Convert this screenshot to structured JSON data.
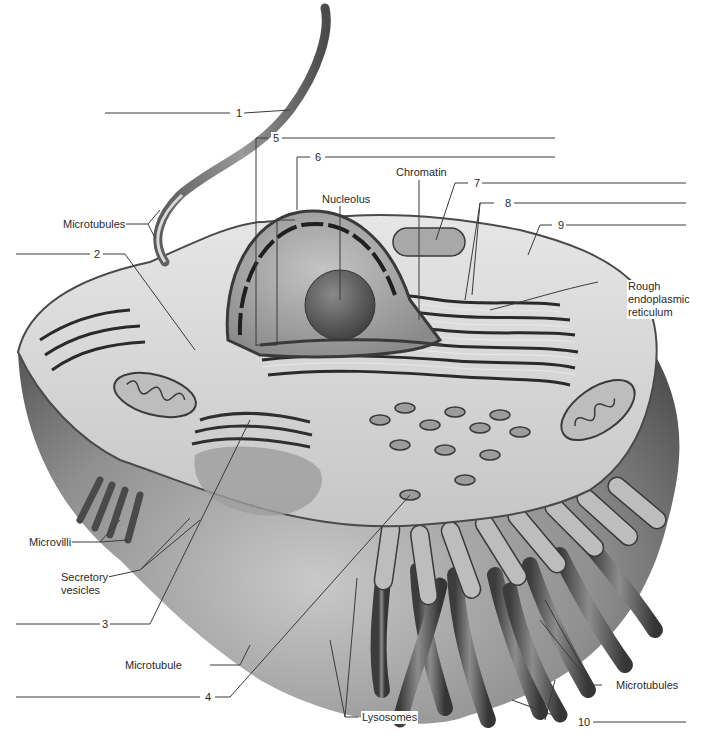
{
  "diagram": {
    "blank_numbers": [
      "1",
      "2",
      "3",
      "4",
      "5",
      "6",
      "7",
      "8",
      "9",
      "10"
    ],
    "labels": {
      "microtubules_flagellum": "Microtubules",
      "nucleolus": "Nucleolus",
      "chromatin": "Chromatin",
      "rough_er_line1": "Rough",
      "rough_er_line2": "endoplasmic",
      "rough_er_line3": "reticulum",
      "microvilli": "Microvilli",
      "secretory_line1": "Secretory",
      "secretory_line2": "vesicles",
      "microtubule": "Microtubule",
      "lysosomes": "Lysosomes",
      "microtubules_cilia": "Microtubules"
    },
    "colors": {
      "background": "#ffffff",
      "leader_line": "#3a3a3a",
      "cytoplasm": "#d8d8d8",
      "membrane_dark": "#3c3c3c",
      "nucleus": "#a9a9a9",
      "nucleolus": "#6e6e6e"
    }
  }
}
